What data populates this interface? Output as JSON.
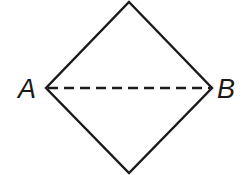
{
  "diagram": {
    "shape": "rhombus",
    "vertices": {
      "top": [
        129,
        2
      ],
      "left": [
        46,
        88
      ],
      "right": [
        212,
        88
      ],
      "bottom": [
        129,
        173
      ]
    },
    "diagonal": {
      "from": "A",
      "to": "B",
      "style": "dashed"
    },
    "labels": {
      "left": "A",
      "right": "B"
    },
    "stroke_color": "#1a1a1a"
  }
}
